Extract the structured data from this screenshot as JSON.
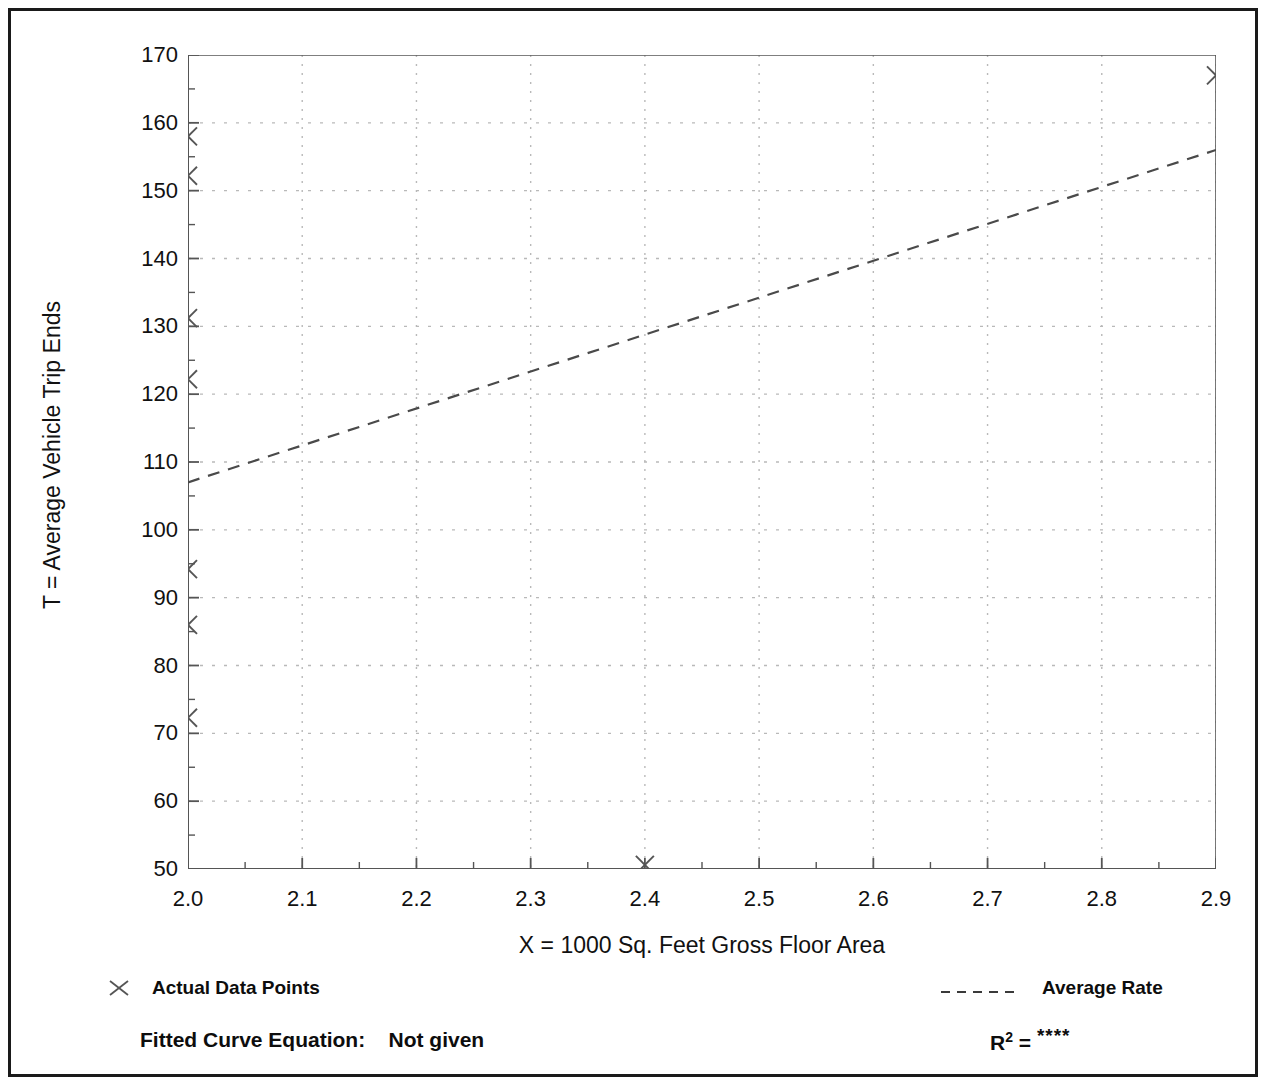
{
  "chart_data": {
    "type": "scatter",
    "title": "",
    "xlabel": "X = 1000 Sq. Feet Gross Floor Area",
    "ylabel": "T = Average Vehicle Trip Ends",
    "xlim": [
      2.0,
      2.9
    ],
    "ylim": [
      50,
      170
    ],
    "xticks": [
      "2.0",
      "2.1",
      "2.2",
      "2.3",
      "2.4",
      "2.5",
      "2.6",
      "2.7",
      "2.8",
      "2.9"
    ],
    "xtick_values": [
      2.0,
      2.1,
      2.2,
      2.3,
      2.4,
      2.5,
      2.6,
      2.7,
      2.8,
      2.9
    ],
    "yticks": [
      "50",
      "60",
      "70",
      "80",
      "90",
      "100",
      "110",
      "120",
      "130",
      "140",
      "150",
      "160",
      "170"
    ],
    "ytick_values": [
      50,
      60,
      70,
      80,
      90,
      100,
      110,
      120,
      130,
      140,
      150,
      160,
      170
    ],
    "x_minor_step": 0.05,
    "y_minor_step": 5,
    "grid": true,
    "grid_style": "dotted",
    "grid_color": "#b9b9b9",
    "legend_position": "below-plot",
    "series": [
      {
        "name": "Actual Data Points",
        "type": "scatter",
        "marker": "x",
        "color": "#555555",
        "points": [
          {
            "x": 2.0,
            "y": 158.0
          },
          {
            "x": 2.0,
            "y": 152.2
          },
          {
            "x": 2.0,
            "y": 131.2
          },
          {
            "x": 2.0,
            "y": 122.2
          },
          {
            "x": 2.0,
            "y": 94.2
          },
          {
            "x": 2.0,
            "y": 86.0
          },
          {
            "x": 2.0,
            "y": 72.3
          },
          {
            "x": 2.4,
            "y": 50.6
          },
          {
            "x": 2.9,
            "y": 167.0
          }
        ]
      },
      {
        "name": "Average Rate",
        "type": "line",
        "style": "dashed",
        "color": "#4a4a4a",
        "points": [
          {
            "x": 2.0,
            "y": 107.0
          },
          {
            "x": 2.9,
            "y": 156.0
          }
        ]
      }
    ]
  },
  "legend": {
    "points_label": "Actual Data Points",
    "points_marker_icon": "x-marker-icon",
    "line_label": "Average Rate",
    "line_marker_icon": "dashed-line-icon"
  },
  "footer": {
    "equation_label": "Fitted Curve Equation:",
    "equation_value": "Not given",
    "r2_symbol": "R",
    "r2_exponent": "2",
    "r2_equals": "=",
    "r2_value": "****"
  },
  "colors": {
    "frame": "#1a1a1a",
    "axis": "#555555",
    "grid": "#b9b9b9",
    "marker": "#555555",
    "line": "#4a4a4a",
    "text": "#111111",
    "background": "#ffffff"
  }
}
